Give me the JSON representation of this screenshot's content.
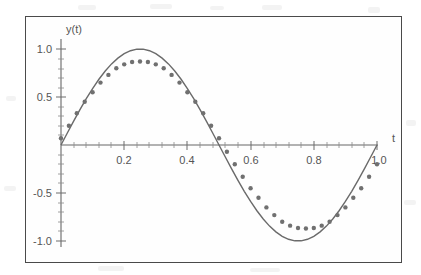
{
  "figure": {
    "frame_color": "#4a4a4a",
    "background": "#ffffff",
    "ink_color": "#6a6a6a"
  },
  "axes": {
    "y_axis_name": "y(t)",
    "x_axis_name": "t",
    "y_ticks": [
      {
        "value": 1.0,
        "label": "1.0"
      },
      {
        "value": 0.5,
        "label": "0.5"
      },
      {
        "value": -0.5,
        "label": "-0.5"
      },
      {
        "value": -1.0,
        "label": "-1.0"
      }
    ],
    "x_ticks": [
      {
        "value": 0.2,
        "label": "0.2"
      },
      {
        "value": 0.4,
        "label": "0.4"
      },
      {
        "value": 0.6,
        "label": "0.6"
      },
      {
        "value": 0.8,
        "label": "0.8"
      },
      {
        "value": 1.0,
        "label": "1.0"
      }
    ]
  },
  "chart_data": {
    "type": "line",
    "title": "",
    "xlabel": "t",
    "ylabel": "y(t)",
    "xlim": [
      0,
      1.02
    ],
    "ylim": [
      -1.08,
      1.08
    ],
    "grid": false,
    "legend": "none",
    "series": [
      {
        "name": "exact-sine",
        "style": "solid-line",
        "color": "#6a6a6a",
        "amplitude": 1.0,
        "expression": "sin(2*pi*t)",
        "x": [
          0,
          0.02,
          0.04,
          0.06,
          0.08,
          0.1,
          0.12,
          0.14,
          0.16,
          0.18,
          0.2,
          0.22,
          0.24,
          0.26,
          0.28,
          0.3,
          0.32,
          0.34,
          0.36,
          0.38,
          0.4,
          0.42,
          0.44,
          0.46,
          0.48,
          0.5,
          0.52,
          0.54,
          0.56,
          0.58,
          0.6,
          0.62,
          0.64,
          0.66,
          0.68,
          0.7,
          0.72,
          0.74,
          0.76,
          0.78,
          0.8,
          0.82,
          0.84,
          0.86,
          0.88,
          0.9,
          0.92,
          0.94,
          0.96,
          0.98,
          1.0
        ],
        "values": [
          0,
          0.125,
          0.249,
          0.368,
          0.482,
          0.588,
          0.685,
          0.771,
          0.845,
          0.905,
          0.951,
          0.982,
          0.998,
          0.998,
          0.982,
          0.951,
          0.905,
          0.845,
          0.771,
          0.685,
          0.588,
          0.482,
          0.368,
          0.249,
          0.125,
          0,
          -0.125,
          -0.249,
          -0.368,
          -0.482,
          -0.588,
          -0.685,
          -0.771,
          -0.845,
          -0.905,
          -0.951,
          -0.982,
          -0.998,
          -0.998,
          -0.982,
          -0.951,
          -0.905,
          -0.845,
          -0.771,
          -0.685,
          -0.588,
          -0.482,
          -0.368,
          -0.249,
          -0.125,
          0
        ]
      },
      {
        "name": "numerical-solution",
        "style": "dotted-markers",
        "color": "#707070",
        "amplitude": 0.87,
        "x": [
          0,
          0.025,
          0.05,
          0.075,
          0.1,
          0.125,
          0.15,
          0.175,
          0.2,
          0.225,
          0.25,
          0.275,
          0.3,
          0.325,
          0.35,
          0.375,
          0.4,
          0.425,
          0.45,
          0.475,
          0.5,
          0.525,
          0.55,
          0.575,
          0.6,
          0.625,
          0.65,
          0.675,
          0.7,
          0.725,
          0.75,
          0.775,
          0.8,
          0.825,
          0.85,
          0.875,
          0.9,
          0.925,
          0.95,
          0.975,
          1.0
        ],
        "values": [
          0.07,
          0.2,
          0.33,
          0.45,
          0.55,
          0.65,
          0.73,
          0.8,
          0.84,
          0.865,
          0.87,
          0.865,
          0.84,
          0.8,
          0.73,
          0.65,
          0.55,
          0.45,
          0.33,
          0.2,
          0.07,
          -0.07,
          -0.2,
          -0.33,
          -0.45,
          -0.55,
          -0.65,
          -0.73,
          -0.8,
          -0.84,
          -0.865,
          -0.87,
          -0.865,
          -0.84,
          -0.8,
          -0.73,
          -0.65,
          -0.55,
          -0.45,
          -0.33,
          -0.2
        ]
      }
    ]
  }
}
